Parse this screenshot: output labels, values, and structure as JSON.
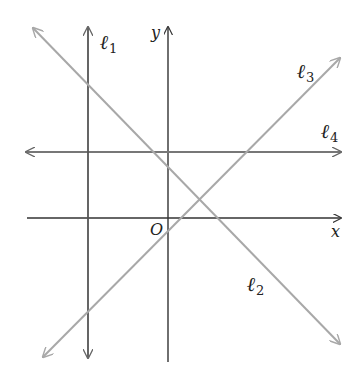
{
  "diagram": {
    "type": "coordinate-plane-lines",
    "axes": {
      "x_label": "x",
      "y_label": "y",
      "origin_label": "O",
      "color": "#333333"
    },
    "lines": [
      {
        "id": "l1",
        "name": "ℓ",
        "sub": "1",
        "orientation": "vertical",
        "color": "#555555"
      },
      {
        "id": "l2",
        "name": "ℓ",
        "sub": "2",
        "orientation": "negative-slope",
        "color": "#a8a8a8"
      },
      {
        "id": "l3",
        "name": "ℓ",
        "sub": "3",
        "orientation": "positive-slope",
        "color": "#a8a8a8"
      },
      {
        "id": "l4",
        "name": "ℓ",
        "sub": "4",
        "orientation": "horizontal",
        "color": "#777777"
      }
    ]
  }
}
